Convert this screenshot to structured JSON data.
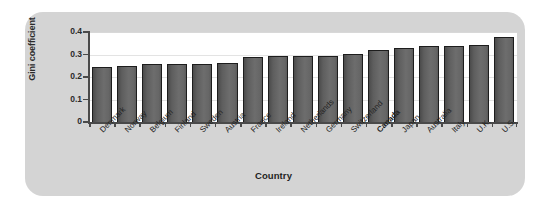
{
  "chart_data": {
    "type": "bar",
    "title": "",
    "xlabel": "Country",
    "ylabel": "Gini coefficient",
    "ylim": [
      0,
      0.4
    ],
    "ytick_labels": [
      "0",
      "0.1",
      "0.2",
      "0.3",
      "0.4"
    ],
    "ytick_values": [
      0,
      0.1,
      0.2,
      0.3,
      0.4
    ],
    "grid": true,
    "legend": "none",
    "highlight_category": "Canada",
    "categories": [
      "Denmark",
      "Norway",
      "Belgium",
      "Finland",
      "Sweden",
      "Austria",
      "France",
      "Ireland",
      "Netherlands",
      "Germany",
      "Switzerland",
      "Canada",
      "Japan",
      "Australia",
      "Italy",
      "U.K.",
      "U.S."
    ],
    "values": [
      0.245,
      0.249,
      0.257,
      0.257,
      0.257,
      0.261,
      0.291,
      0.292,
      0.294,
      0.295,
      0.304,
      0.322,
      0.328,
      0.336,
      0.337,
      0.341,
      0.378
    ],
    "bars": [
      {
        "category": "Denmark",
        "value": 0.245,
        "highlight": false
      },
      {
        "category": "Norway",
        "value": 0.249,
        "highlight": false
      },
      {
        "category": "Belgium",
        "value": 0.257,
        "highlight": false
      },
      {
        "category": "Finland",
        "value": 0.257,
        "highlight": false
      },
      {
        "category": "Sweden",
        "value": 0.257,
        "highlight": false
      },
      {
        "category": "Austria",
        "value": 0.261,
        "highlight": false
      },
      {
        "category": "France",
        "value": 0.291,
        "highlight": false
      },
      {
        "category": "Ireland",
        "value": 0.292,
        "highlight": false
      },
      {
        "category": "Netherlands",
        "value": 0.294,
        "highlight": false
      },
      {
        "category": "Germany",
        "value": 0.295,
        "highlight": false
      },
      {
        "category": "Switzerland",
        "value": 0.304,
        "highlight": false
      },
      {
        "category": "Canada",
        "value": 0.322,
        "highlight": true
      },
      {
        "category": "Japan",
        "value": 0.328,
        "highlight": false
      },
      {
        "category": "Australia",
        "value": 0.336,
        "highlight": false
      },
      {
        "category": "Italy",
        "value": 0.337,
        "highlight": false
      },
      {
        "category": "U.K.",
        "value": 0.341,
        "highlight": false
      },
      {
        "category": "U.S.",
        "value": 0.378,
        "highlight": false
      }
    ]
  },
  "colors": {
    "panel_background": "#d4d4d4",
    "plot_background": "#ffffff",
    "bar_fill_dark": "#4b4b4b",
    "bar_fill_light": "#6d6d6d",
    "bar_outline": "#1d1d1d",
    "axis": "#4a4a4a",
    "gridline": "#e3e3e3",
    "text": "#232323"
  }
}
